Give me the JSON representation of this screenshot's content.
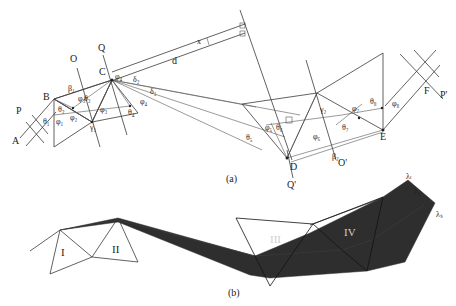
{
  "figure": {
    "panel_a": {
      "caption": "(a)",
      "points": {
        "A": "A",
        "B": "B",
        "C": "C",
        "D": "D",
        "E": "E",
        "F": "F"
      },
      "lines": {
        "P": "P",
        "O": "O",
        "Q": "Q",
        "Q_prime": "Q'",
        "O_prime": "O'",
        "P_prime": "P'"
      },
      "angles": {
        "theta1": "θ₁",
        "theta2": "θ₂",
        "theta3": "θ₃",
        "theta4": "θ₄",
        "theta5": "θ₅",
        "theta6": "θ₆",
        "theta7": "θ₇",
        "theta8": "θ₈",
        "phi1": "φ₁",
        "phi2": "φ₂",
        "phi3": "φ₃",
        "phi4": "φ₄",
        "phi5": "φ₅",
        "phi6": "φ₆",
        "phi7": "φ₇",
        "phi8": "φ₈",
        "beta1": "β₁",
        "beta2": "β₂",
        "gamma1": "γ₁",
        "gamma2": "γ₂",
        "delta1": "δ₁",
        "delta2": "δ₂"
      },
      "distances": {
        "d": "d",
        "x": "x"
      }
    },
    "panel_b": {
      "caption": "(b)",
      "prisms": [
        "I",
        "II",
        "III",
        "IV"
      ],
      "wavelengths": {
        "lambda_l": "λₗ",
        "lambda_0": "λ₀",
        "lambda_s": "λₛ"
      },
      "beam_color": "#2e2e2e"
    }
  }
}
